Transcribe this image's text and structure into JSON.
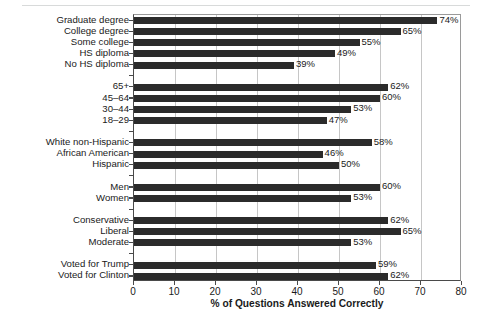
{
  "chart_data": {
    "type": "bar",
    "orientation": "horizontal",
    "title": "",
    "xlabel": "% of Questions Answered Correctly",
    "ylabel": "",
    "xlim": [
      0,
      80
    ],
    "xticks": [
      0,
      10,
      20,
      30,
      40,
      50,
      60,
      70,
      80
    ],
    "grid": "vertical",
    "legend": "none",
    "bar_color": "#2b2b2b",
    "value_label_suffix": "%",
    "categories": [
      "Graduate degree",
      "College degree",
      "Some college",
      "HS diploma",
      "No HS diploma",
      "65+",
      "45–64",
      "30–44",
      "18–29",
      "White non-Hispanic",
      "African American",
      "Hispanic",
      "Men",
      "Women",
      "Conservative",
      "Liberal",
      "Moderate",
      "Voted for Trump",
      "Voted for Clinton"
    ],
    "values": [
      74,
      65,
      55,
      49,
      39,
      62,
      60,
      53,
      47,
      58,
      46,
      50,
      60,
      53,
      62,
      65,
      53,
      59,
      62
    ],
    "value_labels": [
      "74%",
      "65%",
      "55%",
      "49%",
      "39%",
      "62%",
      "60%",
      "53%",
      "47%",
      "58%",
      "46%",
      "50%",
      "60%",
      "53%",
      "62%",
      "65%",
      "53%",
      "59%",
      "62%"
    ],
    "groups": [
      {
        "name": "Education",
        "categories": [
          "Graduate degree",
          "College degree",
          "Some college",
          "HS diploma",
          "No HS diploma"
        ],
        "values": [
          74,
          65,
          55,
          49,
          39
        ]
      },
      {
        "name": "Age",
        "categories": [
          "65+",
          "45–64",
          "30–44",
          "18–29"
        ],
        "values": [
          62,
          60,
          53,
          47
        ]
      },
      {
        "name": "Race/Ethnicity",
        "categories": [
          "White non-Hispanic",
          "African American",
          "Hispanic"
        ],
        "values": [
          58,
          46,
          50
        ]
      },
      {
        "name": "Gender",
        "categories": [
          "Men",
          "Women"
        ],
        "values": [
          60,
          53
        ]
      },
      {
        "name": "Ideology",
        "categories": [
          "Conservative",
          "Liberal",
          "Moderate"
        ],
        "values": [
          62,
          65,
          53
        ]
      },
      {
        "name": "2016 Vote",
        "categories": [
          "Voted for Trump",
          "Voted for Clinton"
        ],
        "values": [
          59,
          62
        ]
      }
    ],
    "rows": [
      {
        "label": "Graduate degree",
        "value": 74,
        "value_label": "74%",
        "spacer": false
      },
      {
        "label": "College degree",
        "value": 65,
        "value_label": "65%",
        "spacer": false
      },
      {
        "label": "Some college",
        "value": 55,
        "value_label": "55%",
        "spacer": false
      },
      {
        "label": "HS diploma",
        "value": 49,
        "value_label": "49%",
        "spacer": false
      },
      {
        "label": "No HS diploma",
        "value": 39,
        "value_label": "39%",
        "spacer": false
      },
      {
        "label": "",
        "value": null,
        "value_label": "",
        "spacer": true
      },
      {
        "label": "65+",
        "value": 62,
        "value_label": "62%",
        "spacer": false
      },
      {
        "label": "45–64",
        "value": 60,
        "value_label": "60%",
        "spacer": false
      },
      {
        "label": "30–44",
        "value": 53,
        "value_label": "53%",
        "spacer": false
      },
      {
        "label": "18–29",
        "value": 47,
        "value_label": "47%",
        "spacer": false
      },
      {
        "label": "",
        "value": null,
        "value_label": "",
        "spacer": true
      },
      {
        "label": "White non-Hispanic",
        "value": 58,
        "value_label": "58%",
        "spacer": false
      },
      {
        "label": "African American",
        "value": 46,
        "value_label": "46%",
        "spacer": false
      },
      {
        "label": "Hispanic",
        "value": 50,
        "value_label": "50%",
        "spacer": false
      },
      {
        "label": "",
        "value": null,
        "value_label": "",
        "spacer": true
      },
      {
        "label": "Men",
        "value": 60,
        "value_label": "60%",
        "spacer": false
      },
      {
        "label": "Women",
        "value": 53,
        "value_label": "53%",
        "spacer": false
      },
      {
        "label": "",
        "value": null,
        "value_label": "",
        "spacer": true
      },
      {
        "label": "Conservative",
        "value": 62,
        "value_label": "62%",
        "spacer": false
      },
      {
        "label": "Liberal",
        "value": 65,
        "value_label": "65%",
        "spacer": false
      },
      {
        "label": "Moderate",
        "value": 53,
        "value_label": "53%",
        "spacer": false
      },
      {
        "label": "",
        "value": null,
        "value_label": "",
        "spacer": true
      },
      {
        "label": "Voted for Trump",
        "value": 59,
        "value_label": "59%",
        "spacer": false
      },
      {
        "label": "Voted for Clinton",
        "value": 62,
        "value_label": "62%",
        "spacer": false
      }
    ]
  }
}
